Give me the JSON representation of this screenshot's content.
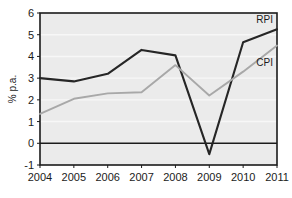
{
  "chart_data": {
    "type": "line",
    "title": "",
    "subtitle": "",
    "xlabel": "",
    "ylabel": "% p.a.",
    "categories": [
      "2004",
      "2005",
      "2006",
      "2007",
      "2008",
      "2009",
      "2010",
      "2011"
    ],
    "x": [
      2004,
      2005,
      2006,
      2007,
      2008,
      2009,
      2010,
      2011
    ],
    "xlim": [
      2004,
      2011
    ],
    "ylim": [
      -1,
      6
    ],
    "yticks": [
      "6",
      "5",
      "4",
      "3",
      "2",
      "1",
      "0",
      "-1"
    ],
    "ytick_values": [
      6,
      5,
      4,
      3,
      2,
      1,
      0,
      -1
    ],
    "grid": true,
    "grid_axis": "y",
    "legend_position": "inline-right",
    "zero_line": 0,
    "series": [
      {
        "name": "RPI",
        "label": "RPI",
        "color": "#262626",
        "values": [
          3.0,
          2.85,
          3.2,
          4.3,
          4.05,
          -0.5,
          4.65,
          5.25
        ]
      },
      {
        "name": "CPI",
        "label": "CPI",
        "color": "#a8a8a8",
        "values": [
          1.35,
          2.05,
          2.3,
          2.35,
          3.6,
          2.2,
          3.3,
          4.5
        ]
      }
    ]
  },
  "colors": {
    "plot_background": "#ebebeb",
    "figure_background": "#ffffff",
    "gridline": "#f7f7f7",
    "axis": "#1b1b1b",
    "rpi": "#262626",
    "cpi": "#a8a8a8"
  }
}
